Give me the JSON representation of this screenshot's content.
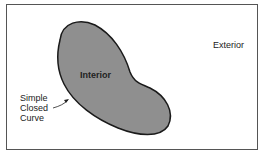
{
  "diagram": {
    "labels": {
      "interior": "Interior",
      "exterior": "Exterior",
      "curve_line1": "Simple",
      "curve_line2": "Closed",
      "curve_line3": "Curve"
    },
    "colors": {
      "region_fill": "#8f8f8f",
      "outline": "#1a1a1a",
      "frame": "#555555"
    }
  }
}
